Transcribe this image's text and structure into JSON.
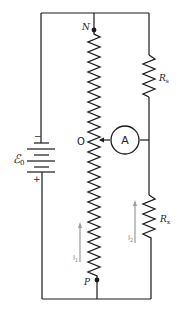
{
  "figure": {
    "type": "circuit-diagram",
    "nodes": {
      "top": "N",
      "bottom": "P",
      "slider": "O"
    },
    "battery": {
      "label": "ℰ",
      "subscript": "0",
      "minus_sign": "−",
      "plus_sign": "+"
    },
    "resistors": {
      "upper_right": {
        "label": "R",
        "subscript": "s"
      },
      "lower_right": {
        "label": "R",
        "subscript": "x"
      }
    },
    "ammeter": {
      "label": "A"
    },
    "currents": [
      {
        "label": "I",
        "subscript": "1",
        "direction": "up",
        "branch": "slide-wire"
      },
      {
        "label": "I",
        "subscript": "2",
        "direction": "up",
        "branch": "Rx"
      }
    ],
    "colors": {
      "wire": "#1a1a1a",
      "current_arrow": "#9a9a9a",
      "background": "#ffffff"
    }
  }
}
